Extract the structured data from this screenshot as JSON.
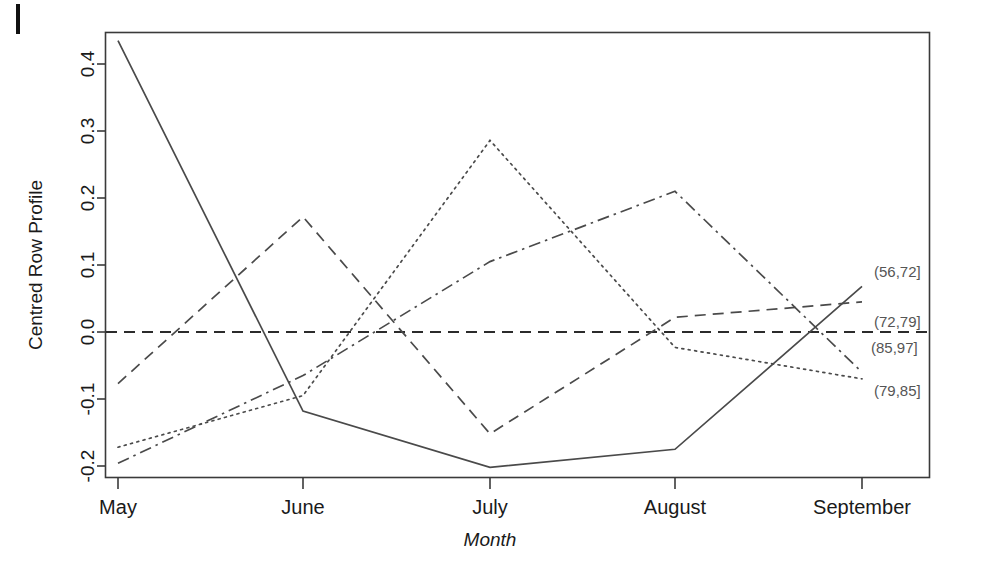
{
  "chart_data": {
    "type": "line",
    "title": "",
    "subtitle": "",
    "xlabel": "Month",
    "ylabel": "Centred Row Profile",
    "categories": [
      "May",
      "June",
      "July",
      "August",
      "September"
    ],
    "x_tick_labels": [
      "May",
      "June",
      "July",
      "August",
      "September"
    ],
    "y_tick_labels": [
      "0.4",
      "0.3",
      "0.2",
      "0.1",
      "0.0",
      "-0.1",
      "-0.2"
    ],
    "y_tick_values": [
      0.4,
      0.3,
      0.2,
      0.1,
      0.0,
      -0.1,
      -0.2
    ],
    "ylim": [
      -0.23,
      0.46
    ],
    "grid": false,
    "legend_position": "right-inline-labels",
    "reference_line": {
      "value": 0.0,
      "style": "dashed",
      "label": ""
    },
    "series": [
      {
        "name": "(56,72]",
        "style": "solid",
        "values": [
          0.435,
          -0.118,
          -0.202,
          -0.175,
          0.068
        ]
      },
      {
        "name": "(72,79]",
        "style": "dashed",
        "values": [
          -0.077,
          0.172,
          -0.152,
          0.022,
          0.045
        ]
      },
      {
        "name": "(85,97]",
        "style": "dashdot",
        "values": [
          -0.196,
          -0.065,
          0.105,
          0.21,
          -0.06
        ]
      },
      {
        "name": "(79,85]",
        "style": "dotted",
        "values": [
          -0.172,
          -0.095,
          0.286,
          -0.023,
          -0.07
        ]
      }
    ],
    "inline_labels": [
      {
        "text": "(56,72]",
        "series": "(56,72]"
      },
      {
        "text": "(72,79]",
        "series": "(72,79]"
      },
      {
        "text": "(85,97]",
        "series": "(85,97]"
      },
      {
        "text": "(79,85]",
        "series": "(79,85]"
      }
    ]
  },
  "axis": {
    "y_title": "Centred Row Profile",
    "x_title": "Month"
  },
  "yticks": {
    "t0": "0.4",
    "t1": "0.3",
    "t2": "0.2",
    "t3": "0.1",
    "t4": "0.0",
    "t5": "-0.1",
    "t6": "-0.2"
  },
  "xticks": {
    "t0": "May",
    "t1": "June",
    "t2": "July",
    "t3": "August",
    "t4": "September"
  },
  "labels": {
    "l0": "(56,72]",
    "l1": "(72,79]",
    "l2": "(85,97]",
    "l3": "(79,85]"
  },
  "colors": {
    "ink": "#3a3a3a",
    "series_ink": "#4a4a4a",
    "label_ink": "#555555",
    "background": "#ffffff"
  }
}
